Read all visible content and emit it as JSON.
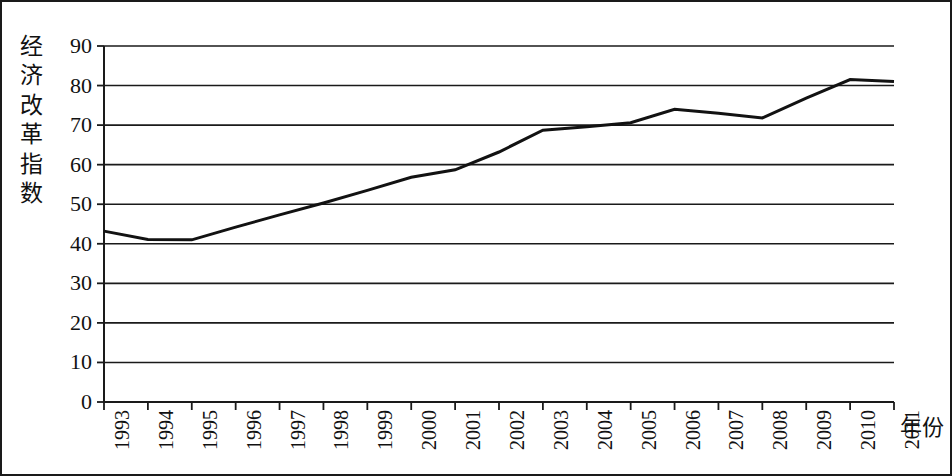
{
  "chart_data": {
    "type": "line",
    "title": "",
    "subtitle": "",
    "xlabel": "年份",
    "ylabel": "经济改革指数",
    "x": [
      1993,
      1994,
      1995,
      1996,
      1997,
      1998,
      1999,
      2000,
      2001,
      2002,
      2003,
      2004,
      2005,
      2006,
      2007,
      2008,
      2009,
      2010,
      2011
    ],
    "categories": [
      "1993",
      "1994",
      "1995",
      "1996",
      "1997",
      "1998",
      "1999",
      "2000",
      "2001",
      "2002",
      "2003",
      "2004",
      "2005",
      "2006",
      "2007",
      "2008",
      "2009",
      "2010",
      "2011"
    ],
    "series": [
      {
        "name": "经济改革指数",
        "values": [
          43.2,
          41.1,
          41.0,
          44.2,
          47.3,
          50.3,
          53.5,
          56.8,
          58.7,
          63.2,
          68.7,
          69.6,
          70.6,
          74.0,
          73.0,
          71.8,
          76.8,
          81.5,
          81.0
        ]
      }
    ],
    "ylim": [
      0,
      90
    ],
    "ytick_interval": 10,
    "yticks": [
      "0",
      "10",
      "20",
      "30",
      "40",
      "50",
      "60",
      "70",
      "80",
      "90"
    ],
    "grid": "horizontal",
    "legend": "none",
    "line_color": "#121212",
    "line_width": 3,
    "markers": "none",
    "frame": "outer-border"
  },
  "figure": {
    "border_color": "#1a1a1a",
    "background": "#ffffff"
  }
}
